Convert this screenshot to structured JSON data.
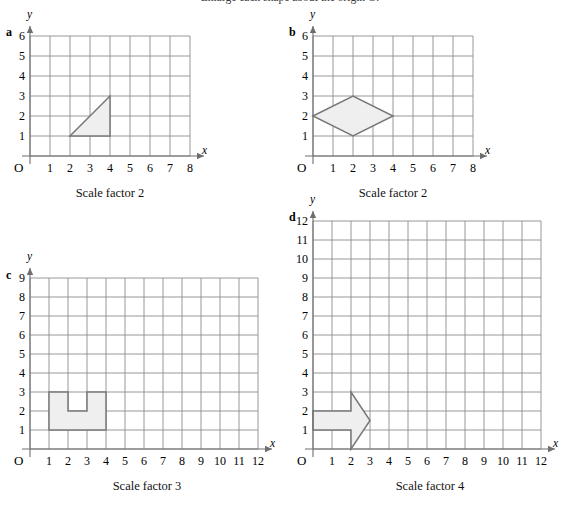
{
  "header": {
    "instruction": "Enlarge each shape about the origin O."
  },
  "panels": [
    {
      "id": "a",
      "letter": "a",
      "caption": "Scale factor 2",
      "axis": {
        "x_label": "x",
        "y_label": "y",
        "origin_label": "O"
      },
      "x_ticks": [
        "1",
        "2",
        "3",
        "4",
        "5",
        "6",
        "7",
        "8"
      ],
      "y_ticks": [
        "1",
        "2",
        "3",
        "4",
        "5",
        "6"
      ],
      "x_max": 8,
      "y_max": 6,
      "shape_name": "right-triangle",
      "shape_points": [
        [
          2,
          1
        ],
        [
          4,
          1
        ],
        [
          4,
          3
        ]
      ]
    },
    {
      "id": "b",
      "letter": "b",
      "caption": "Scale factor 2",
      "axis": {
        "x_label": "x",
        "y_label": "y",
        "origin_label": "O"
      },
      "x_ticks": [
        "1",
        "2",
        "3",
        "4",
        "5",
        "6",
        "7",
        "8"
      ],
      "y_ticks": [
        "1",
        "2",
        "3",
        "4",
        "5",
        "6"
      ],
      "x_max": 8,
      "y_max": 6,
      "shape_name": "rhombus",
      "shape_points": [
        [
          0,
          2
        ],
        [
          2,
          3
        ],
        [
          4,
          2
        ],
        [
          2,
          1
        ]
      ]
    },
    {
      "id": "c",
      "letter": "c",
      "caption": "Scale factor 3",
      "axis": {
        "x_label": "x",
        "y_label": "y",
        "origin_label": "O"
      },
      "x_ticks": [
        "1",
        "2",
        "3",
        "4",
        "5",
        "6",
        "7",
        "8",
        "9",
        "10",
        "11",
        "12"
      ],
      "y_ticks": [
        "1",
        "2",
        "3",
        "4",
        "5",
        "6",
        "7",
        "8",
        "9"
      ],
      "x_max": 12,
      "y_max": 9,
      "shape_name": "u-shape",
      "shape_points": [
        [
          1,
          1
        ],
        [
          4,
          1
        ],
        [
          4,
          3
        ],
        [
          3,
          3
        ],
        [
          3,
          2
        ],
        [
          2,
          2
        ],
        [
          2,
          3
        ],
        [
          1,
          3
        ]
      ]
    },
    {
      "id": "d",
      "letter": "d",
      "caption": "Scale factor 4",
      "axis": {
        "x_label": "x",
        "y_label": "y",
        "origin_label": "O"
      },
      "x_ticks": [
        "1",
        "2",
        "3",
        "4",
        "5",
        "6",
        "7",
        "8",
        "9",
        "10",
        "11",
        "12"
      ],
      "y_ticks": [
        "1",
        "2",
        "3",
        "4",
        "5",
        "6",
        "7",
        "8",
        "9",
        "10",
        "11",
        "12"
      ],
      "x_max": 12,
      "y_max": 12,
      "shape_name": "right-arrow",
      "shape_points": [
        [
          0,
          1
        ],
        [
          2,
          1
        ],
        [
          2,
          0
        ],
        [
          3,
          1.5
        ],
        [
          2,
          3
        ],
        [
          2,
          2
        ],
        [
          0,
          2
        ]
      ]
    }
  ],
  "chart_data": {
    "type": "scatter",
    "title": "Enlarge each shape about the origin O.",
    "xlabel": "x",
    "ylabel": "y",
    "grid": true,
    "legend": "none",
    "panels": [
      {
        "label": "a",
        "caption": "Scale factor 2",
        "xlim": [
          0,
          8
        ],
        "ylim": [
          0,
          6
        ],
        "xticks": [
          1,
          2,
          3,
          4,
          5,
          6,
          7,
          8
        ],
        "yticks": [
          1,
          2,
          3,
          4,
          5,
          6
        ],
        "shape": "right triangle",
        "vertices": [
          [
            2,
            1
          ],
          [
            4,
            1
          ],
          [
            4,
            3
          ]
        ]
      },
      {
        "label": "b",
        "caption": "Scale factor 2",
        "xlim": [
          0,
          8
        ],
        "ylim": [
          0,
          6
        ],
        "xticks": [
          1,
          2,
          3,
          4,
          5,
          6,
          7,
          8
        ],
        "yticks": [
          1,
          2,
          3,
          4,
          5,
          6
        ],
        "shape": "rhombus",
        "vertices": [
          [
            0,
            2
          ],
          [
            2,
            3
          ],
          [
            4,
            2
          ],
          [
            2,
            1
          ]
        ]
      },
      {
        "label": "c",
        "caption": "Scale factor 3",
        "xlim": [
          0,
          12
        ],
        "ylim": [
          0,
          9
        ],
        "xticks": [
          1,
          2,
          3,
          4,
          5,
          6,
          7,
          8,
          9,
          10,
          11,
          12
        ],
        "yticks": [
          1,
          2,
          3,
          4,
          5,
          6,
          7,
          8,
          9
        ],
        "shape": "U shape (rectangle with notch)",
        "vertices": [
          [
            1,
            1
          ],
          [
            4,
            1
          ],
          [
            4,
            3
          ],
          [
            3,
            3
          ],
          [
            3,
            2
          ],
          [
            2,
            2
          ],
          [
            2,
            3
          ],
          [
            1,
            3
          ]
        ]
      },
      {
        "label": "d",
        "caption": "Scale factor 4",
        "xlim": [
          0,
          12
        ],
        "ylim": [
          0,
          12
        ],
        "xticks": [
          1,
          2,
          3,
          4,
          5,
          6,
          7,
          8,
          9,
          10,
          11,
          12
        ],
        "yticks": [
          1,
          2,
          3,
          4,
          5,
          6,
          7,
          8,
          9,
          10,
          11,
          12
        ],
        "shape": "right-pointing arrow",
        "vertices": [
          [
            0,
            1
          ],
          [
            2,
            1
          ],
          [
            2,
            0
          ],
          [
            3,
            1.5
          ],
          [
            2,
            3
          ],
          [
            2,
            2
          ],
          [
            0,
            2
          ]
        ]
      }
    ]
  }
}
